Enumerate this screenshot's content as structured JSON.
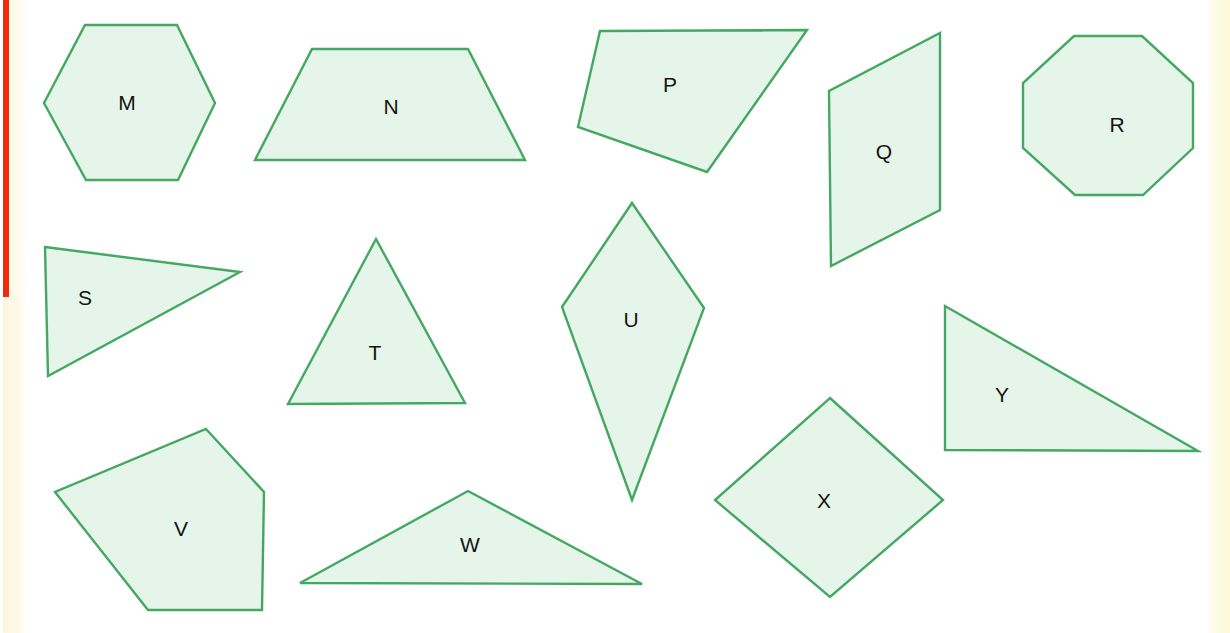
{
  "page": {
    "background_color": "#ffffff",
    "width": 1230,
    "height": 633
  },
  "scan_artifacts": {
    "left_red_bar": {
      "color": "#f22a0c",
      "x": 3,
      "y": 0,
      "width": 6,
      "height": 297
    },
    "left_cream_strip": {
      "color": "#fdf8e4",
      "x": 9,
      "y": 0,
      "width": 19,
      "height": 633
    },
    "right_cream_strip": {
      "color": "#fcf8d8",
      "x": 1206,
      "y": 0,
      "width": 24,
      "height": 633
    }
  },
  "style": {
    "shape_fill": "#e6f5e9",
    "shape_stroke": "#45a862",
    "label_color": "#141414",
    "label_font_size": 21
  },
  "chart_data": {
    "type": "diagram",
    "subtitle": "",
    "xlabel": "",
    "ylabel": "",
    "shape_count": 13,
    "labels": [
      "M",
      "N",
      "P",
      "Q",
      "R",
      "S",
      "T",
      "U",
      "V",
      "W",
      "X",
      "Y"
    ],
    "shapes": [
      {
        "label": "M",
        "name": "hexagon",
        "sides": 6,
        "points": "85,25 177,25 215,103 178,180 86,180 44,103",
        "label_x": 127,
        "label_y": 104
      },
      {
        "label": "N",
        "name": "trapezoid",
        "sides": 4,
        "points": "312,49 468,49 525,160 255,160",
        "label_x": 391,
        "label_y": 108
      },
      {
        "label": "P",
        "name": "quadrilateral",
        "sides": 4,
        "points": "600,31 807,30 707,172 578,127",
        "label_x": 670,
        "label_y": 86
      },
      {
        "label": "Q",
        "name": "parallelogram",
        "sides": 4,
        "points": "940,33 940,210 831,266 829,91",
        "label_x": 884,
        "label_y": 153
      },
      {
        "label": "R",
        "name": "octagon",
        "sides": 8,
        "points": "1074,36 1142,36 1193,83 1193,148 1143,195 1075,195 1023,148 1023,83",
        "label_x": 1117,
        "label_y": 126
      },
      {
        "label": "S",
        "name": "scalene-triangle",
        "sides": 3,
        "points": "45,247 240,272 48,376",
        "label_x": 85,
        "label_y": 299
      },
      {
        "label": "T",
        "name": "isosceles-triangle",
        "sides": 3,
        "points": "376,239 465,403 288,404",
        "label_x": 375,
        "label_y": 354
      },
      {
        "label": "U",
        "name": "kite",
        "sides": 4,
        "points": "632,203 704,308 632,500 562,307",
        "label_x": 631,
        "label_y": 321
      },
      {
        "label": "V",
        "name": "pentagon",
        "sides": 5,
        "points": "206,429 264,492 262,610 148,610 55,492",
        "label_x": 181,
        "label_y": 530
      },
      {
        "label": "W",
        "name": "obtuse-triangle",
        "sides": 3,
        "points": "468,491 642,584 300,583",
        "label_x": 470,
        "label_y": 546
      },
      {
        "label": "X",
        "name": "rhombus",
        "sides": 4,
        "points": "830,398 943,500 830,597 715,500",
        "label_x": 824,
        "label_y": 502
      },
      {
        "label": "Y",
        "name": "right-triangle",
        "sides": 3,
        "points": "945,306 1198,451 945,450",
        "label_x": 1002,
        "label_y": 396
      }
    ]
  }
}
